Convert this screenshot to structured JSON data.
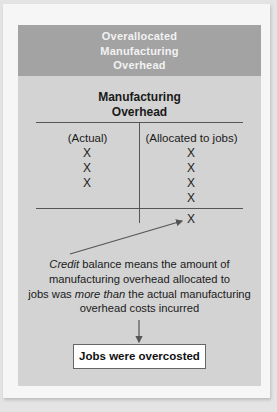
{
  "header": {
    "lines": [
      "Overallocated",
      "Manufacturing",
      "Overhead"
    ]
  },
  "t_account": {
    "title_lines": [
      "Manufacturing",
      "Overhead"
    ],
    "debit_label": "(Actual)",
    "credit_label": "(Allocated to jobs)",
    "debit_entries": [
      "X",
      "X",
      "X"
    ],
    "credit_entries": [
      "X",
      "X",
      "X",
      "X"
    ],
    "credit_balance": "X"
  },
  "explanation": {
    "credit_word": "Credit",
    "line1_rest": " balance means the amount of",
    "line2": "manufacturing overhead allocated to",
    "line3_pre": "jobs was ",
    "line3_emph": "more than",
    "line3_post": " the actual manufacturing",
    "line4": "overhead costs incurred"
  },
  "result": {
    "label": "Jobs were overcosted"
  },
  "colors": {
    "header_bg": "#a3a3a3",
    "panel_bg": "#d3d3d3",
    "card_bg": "#f6f6f6",
    "result_bg": "#ffffff"
  }
}
